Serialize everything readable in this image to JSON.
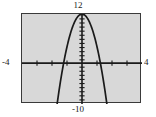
{
  "chart_data": {
    "type": "line",
    "title": "",
    "subtitle": "",
    "xlabel": "",
    "ylabel": "",
    "xlim": [
      -4,
      4
    ],
    "ylim": [
      -10,
      12
    ],
    "grid": false,
    "legend": null,
    "axis_labels": {
      "x_min": "-4",
      "x_max": "4",
      "y_max": "12",
      "y_min": "-10"
    },
    "x_tick_step": 1,
    "y_tick_step": 1,
    "x_ticks": [
      -4,
      -3,
      -2,
      -1,
      0,
      1,
      2,
      3,
      4
    ],
    "y_ticks": [
      -10,
      -9,
      -8,
      -7,
      -6,
      -5,
      -4,
      -3,
      -2,
      -1,
      0,
      1,
      2,
      3,
      4,
      5,
      6,
      7,
      8,
      9,
      10,
      11,
      12
    ],
    "series": [
      {
        "name": "parabola",
        "kind": "parabola",
        "vertex": [
          0,
          12
        ],
        "opens": "down",
        "leading_coefficient": -8,
        "equation": "y = -8x^2 + 12",
        "x_intercepts": [
          -1.22,
          1.22
        ],
        "y_intercept": 12,
        "color": "#1a1a1a",
        "points": [
          {
            "x": -1.56,
            "y": -7.5
          },
          {
            "x": -1.4,
            "y": -3.7
          },
          {
            "x": -1.2,
            "y": 0.5
          },
          {
            "x": -1.0,
            "y": 4.0
          },
          {
            "x": -0.8,
            "y": 6.9
          },
          {
            "x": -0.6,
            "y": 9.1
          },
          {
            "x": -0.4,
            "y": 10.7
          },
          {
            "x": -0.2,
            "y": 11.7
          },
          {
            "x": 0.0,
            "y": 12.0
          },
          {
            "x": 0.2,
            "y": 11.7
          },
          {
            "x": 0.4,
            "y": 10.7
          },
          {
            "x": 0.6,
            "y": 9.1
          },
          {
            "x": 0.8,
            "y": 6.9
          },
          {
            "x": 1.0,
            "y": 4.0
          },
          {
            "x": 1.2,
            "y": 0.5
          },
          {
            "x": 1.4,
            "y": -3.7
          },
          {
            "x": 1.56,
            "y": -7.5
          }
        ]
      }
    ],
    "colors": {
      "plot_background": "#d8d8d8",
      "frame": "#3a3a3a",
      "axis": "#1a1a1a",
      "curve": "#1a1a1a",
      "page_background": "#ffffff",
      "text": "#1a1a1a"
    }
  }
}
